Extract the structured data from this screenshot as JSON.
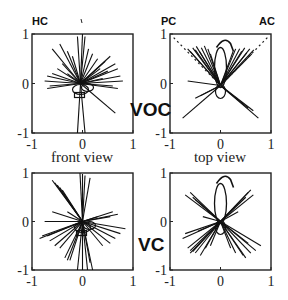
{
  "figure": {
    "row_labels": [
      "VOC",
      "VC"
    ],
    "view_labels": [
      "front view",
      "top view"
    ],
    "axis_ticks": [
      "-1",
      "0",
      "1"
    ],
    "top_left_marker": "HC",
    "top_right_markers": [
      "PC",
      "AC"
    ]
  },
  "panels": [
    {
      "id": "voc-front",
      "row": "VOC",
      "view": "front view",
      "marker_labels": [
        "HC"
      ],
      "xlim": [
        -1,
        1
      ],
      "ylim": [
        -1,
        1
      ],
      "rays": [
        [
          -0.6,
          0.7
        ],
        [
          -0.45,
          0.8
        ],
        [
          -0.3,
          0.65
        ],
        [
          -0.1,
          0.95
        ],
        [
          0.0,
          1.0
        ],
        [
          0.05,
          0.95
        ],
        [
          0.12,
          0.7
        ],
        [
          0.3,
          0.5
        ],
        [
          0.45,
          0.45
        ],
        [
          0.55,
          0.55
        ],
        [
          0.65,
          0.4
        ],
        [
          0.7,
          0.3
        ],
        [
          0.75,
          0.15
        ],
        [
          0.8,
          0.05
        ],
        [
          0.7,
          -0.1
        ],
        [
          -0.7,
          0.15
        ],
        [
          -0.75,
          0.05
        ],
        [
          -0.7,
          -0.1
        ],
        [
          -0.6,
          0.2
        ],
        [
          -0.5,
          0.3
        ],
        [
          -0.4,
          0.4
        ],
        [
          -0.2,
          0.55
        ],
        [
          0.2,
          0.6
        ],
        [
          0.5,
          0.25
        ],
        [
          0.6,
          -0.05
        ],
        [
          -0.65,
          -0.05
        ],
        [
          0.65,
          -0.6
        ],
        [
          -0.1,
          -1.0
        ],
        [
          0.05,
          -1.0
        ],
        [
          0.35,
          0.3
        ],
        [
          -0.3,
          0.2
        ],
        [
          0.4,
          0.1
        ]
      ],
      "loops": true
    },
    {
      "id": "voc-top",
      "row": "VOC",
      "view": "top view",
      "marker_labels": [
        "PC",
        "AC"
      ],
      "xlim": [
        -1,
        1
      ],
      "ylim": [
        -1,
        1
      ],
      "rays": [
        [
          -0.65,
          0.7
        ],
        [
          -0.6,
          0.65
        ],
        [
          -0.55,
          0.72
        ],
        [
          -0.5,
          0.68
        ],
        [
          -0.48,
          0.75
        ],
        [
          -0.42,
          0.65
        ],
        [
          -0.38,
          0.72
        ],
        [
          -0.32,
          0.76
        ],
        [
          -0.25,
          0.7
        ],
        [
          -0.2,
          0.6
        ],
        [
          0.25,
          0.65
        ],
        [
          0.3,
          0.7
        ],
        [
          0.38,
          0.7
        ],
        [
          0.42,
          0.65
        ],
        [
          0.48,
          0.72
        ],
        [
          0.52,
          0.62
        ],
        [
          0.58,
          0.7
        ],
        [
          0.62,
          0.6
        ],
        [
          0.66,
          0.68
        ],
        [
          -0.65,
          0.05
        ],
        [
          -0.4,
          -0.25
        ],
        [
          -0.5,
          -0.3
        ],
        [
          -0.75,
          -0.7
        ],
        [
          0.75,
          -0.7
        ],
        [
          0.65,
          -0.55
        ],
        [
          0.55,
          -0.5
        ]
      ],
      "dashed": [
        [
          -0.95,
          0.95
        ],
        [
          0.95,
          0.95
        ]
      ],
      "loops": true
    },
    {
      "id": "vc-front",
      "row": "VC",
      "view": "front view",
      "marker_labels": [],
      "xlim": [
        -1,
        1
      ],
      "ylim": [
        -1,
        1
      ],
      "rays": [
        [
          -0.6,
          0.85
        ],
        [
          -0.55,
          0.8
        ],
        [
          -0.5,
          0.75
        ],
        [
          -0.45,
          0.7
        ],
        [
          -0.4,
          0.65
        ],
        [
          -0.05,
          1.0
        ],
        [
          0.0,
          0.98
        ],
        [
          0.05,
          0.95
        ],
        [
          0.15,
          0.9
        ],
        [
          -0.6,
          0.2
        ],
        [
          -0.75,
          0.0
        ],
        [
          -0.85,
          -0.35
        ],
        [
          -0.8,
          -0.3
        ],
        [
          -0.7,
          -0.3
        ],
        [
          -0.65,
          -0.4
        ],
        [
          -0.55,
          -0.5
        ],
        [
          -0.45,
          -0.55
        ],
        [
          -0.35,
          -0.75
        ],
        [
          -0.3,
          -0.8
        ],
        [
          -0.25,
          -0.8
        ],
        [
          -0.1,
          -1.0
        ],
        [
          0.0,
          -1.0
        ],
        [
          0.1,
          -1.0
        ],
        [
          0.2,
          -1.0
        ],
        [
          0.15,
          -0.85
        ],
        [
          0.4,
          -0.5
        ],
        [
          0.55,
          -0.45
        ],
        [
          0.65,
          -0.35
        ],
        [
          0.75,
          -0.25
        ],
        [
          0.85,
          -0.15
        ],
        [
          0.6,
          0.2
        ],
        [
          0.7,
          0.15
        ],
        [
          0.55,
          0.1
        ],
        [
          -0.3,
          0.2
        ],
        [
          0.3,
          0.1
        ]
      ],
      "loops": true
    },
    {
      "id": "vc-top",
      "row": "VC",
      "view": "top view",
      "marker_labels": [],
      "xlim": [
        -1,
        1
      ],
      "ylim": [
        -1,
        1
      ],
      "rays": [
        [
          -0.7,
          0.55
        ],
        [
          -0.6,
          0.6
        ],
        [
          -0.55,
          0.5
        ],
        [
          -0.5,
          0.45
        ],
        [
          0.5,
          0.5
        ],
        [
          0.55,
          0.6
        ],
        [
          0.6,
          0.65
        ],
        [
          0.65,
          0.55
        ],
        [
          -0.7,
          -0.25
        ],
        [
          -0.75,
          -0.35
        ],
        [
          -0.65,
          -0.55
        ],
        [
          -0.6,
          -0.65
        ],
        [
          -0.6,
          -0.6
        ],
        [
          -0.55,
          -0.62
        ],
        [
          -0.5,
          -0.65
        ],
        [
          -0.4,
          -0.7
        ],
        [
          -0.3,
          -0.55
        ],
        [
          -0.2,
          -0.5
        ],
        [
          0.2,
          -0.55
        ],
        [
          0.3,
          -0.65
        ],
        [
          0.45,
          -0.7
        ],
        [
          0.5,
          -0.75
        ],
        [
          0.6,
          -0.65
        ],
        [
          0.7,
          -0.6
        ],
        [
          0.8,
          -0.5
        ],
        [
          0.55,
          -0.45
        ],
        [
          -0.45,
          -0.2
        ],
        [
          0.35,
          0.2
        ],
        [
          -0.35,
          0.1
        ]
      ],
      "loops": true
    }
  ]
}
